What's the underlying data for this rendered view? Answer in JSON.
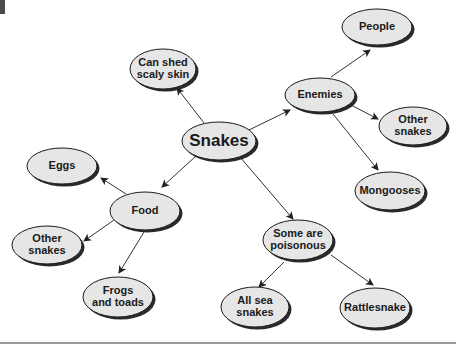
{
  "diagram": {
    "type": "concept-map",
    "central": "Snakes",
    "nodes": [
      {
        "id": "snakes",
        "label": "Snakes",
        "cx": 219,
        "cy": 141,
        "rx": 37,
        "ry": 19,
        "fs": 17
      },
      {
        "id": "can_shed",
        "label": "Can shed\nscaly skin",
        "cx": 163,
        "cy": 69,
        "rx": 33,
        "ry": 20,
        "fs": 11
      },
      {
        "id": "enemies",
        "label": "Enemies",
        "cx": 320,
        "cy": 95,
        "rx": 35,
        "ry": 17,
        "fs": 11
      },
      {
        "id": "people",
        "label": "People",
        "cx": 377,
        "cy": 27,
        "rx": 35,
        "ry": 18,
        "fs": 11
      },
      {
        "id": "other_snakes_enemy",
        "label": "Other\nsnakes",
        "cx": 413,
        "cy": 126,
        "rx": 34,
        "ry": 19,
        "fs": 11
      },
      {
        "id": "mongooses",
        "label": "Mongooses",
        "cx": 390,
        "cy": 191,
        "rx": 35,
        "ry": 19,
        "fs": 11
      },
      {
        "id": "eggs",
        "label": "Eggs",
        "cx": 62,
        "cy": 166,
        "rx": 35,
        "ry": 18,
        "fs": 11
      },
      {
        "id": "food",
        "label": "Food",
        "cx": 145,
        "cy": 211,
        "rx": 35,
        "ry": 19,
        "fs": 11
      },
      {
        "id": "other_snakes_food",
        "label": "Other\nsnakes",
        "cx": 47,
        "cy": 245,
        "rx": 35,
        "ry": 19,
        "fs": 11
      },
      {
        "id": "frogs",
        "label": "Frogs\nand toads",
        "cx": 118,
        "cy": 297,
        "rx": 35,
        "ry": 20,
        "fs": 11
      },
      {
        "id": "poisonous",
        "label": "Some are\npoisonous",
        "cx": 298,
        "cy": 240,
        "rx": 35,
        "ry": 20,
        "fs": 11
      },
      {
        "id": "all_sea",
        "label": "All sea\nsnakes",
        "cx": 255,
        "cy": 307,
        "rx": 34,
        "ry": 20,
        "fs": 11
      },
      {
        "id": "rattlesnake",
        "label": "Rattlesnake",
        "cx": 375,
        "cy": 308,
        "rx": 35,
        "ry": 20,
        "fs": 11
      }
    ],
    "edges": [
      {
        "from": "snakes",
        "to": "can_shed",
        "x1": 204,
        "y1": 123,
        "x2": 177,
        "y2": 88
      },
      {
        "from": "snakes",
        "to": "enemies",
        "x1": 249,
        "y1": 130,
        "x2": 290,
        "y2": 110
      },
      {
        "from": "snakes",
        "to": "food",
        "x1": 196,
        "y1": 156,
        "x2": 162,
        "y2": 187
      },
      {
        "from": "snakes",
        "to": "poisonous",
        "x1": 240,
        "y1": 157,
        "x2": 293,
        "y2": 219
      },
      {
        "from": "enemies",
        "to": "people",
        "x1": 331,
        "y1": 77,
        "x2": 370,
        "y2": 50
      },
      {
        "from": "enemies",
        "to": "other_snakes_enemy",
        "x1": 349,
        "y1": 104,
        "x2": 378,
        "y2": 119
      },
      {
        "from": "enemies",
        "to": "mongooses",
        "x1": 333,
        "y1": 114,
        "x2": 378,
        "y2": 170
      },
      {
        "from": "food",
        "to": "eggs",
        "x1": 126,
        "y1": 194,
        "x2": 101,
        "y2": 178
      },
      {
        "from": "food",
        "to": "other_snakes_food",
        "x1": 114,
        "y1": 220,
        "x2": 84,
        "y2": 241
      },
      {
        "from": "food",
        "to": "frogs",
        "x1": 144,
        "y1": 232,
        "x2": 119,
        "y2": 273
      },
      {
        "from": "poisonous",
        "to": "all_sea",
        "x1": 284,
        "y1": 262,
        "x2": 259,
        "y2": 287
      },
      {
        "from": "poisonous",
        "to": "rattlesnake",
        "x1": 331,
        "y1": 255,
        "x2": 373,
        "y2": 285
      }
    ]
  },
  "colors": {
    "node_fill": "#e6e6e6",
    "node_stroke": "#1a1a1a",
    "shadow": "#2a2a2a",
    "edge": "#333333",
    "text": "#1a1a1a"
  }
}
